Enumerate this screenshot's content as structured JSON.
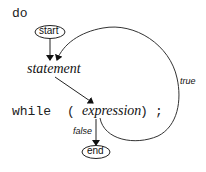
{
  "diagram": {
    "keywords": {
      "do": "do",
      "while": "while",
      "open_paren": "(",
      "close_paren": ")",
      "semicolon": ";"
    },
    "nodes": {
      "start": "start",
      "statement": "statement",
      "expression": "expression",
      "end": "end"
    },
    "edges": {
      "true_label": "true",
      "false_label": "false"
    },
    "colors": {
      "line": "#333333",
      "background": "#ffffff"
    }
  }
}
